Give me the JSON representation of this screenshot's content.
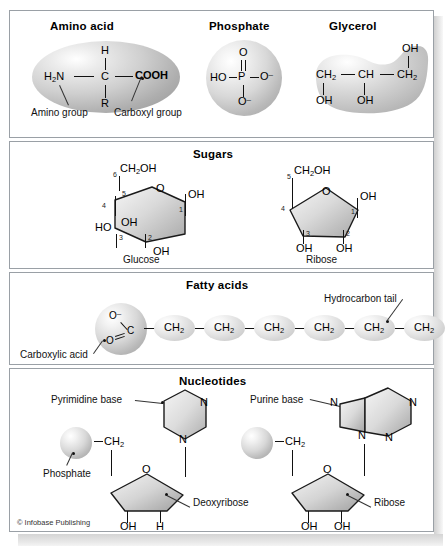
{
  "figure": {
    "credit": "© Infobase Publishing"
  },
  "panels": {
    "monomers": {
      "amino_acid": {
        "title": "Amino acid",
        "top_atom": "H",
        "left_group": "H2N",
        "center_atom": "C",
        "right_group": "COOH",
        "bottom_atom": "R",
        "callout_left": "Amino group",
        "callout_right": "Carboxyl group"
      },
      "phosphate": {
        "title": "Phosphate",
        "top_atom": "O",
        "left_group": "HO",
        "center_atom": "P",
        "right_group": "O−",
        "bottom_group": "O−"
      },
      "glycerol": {
        "title": "Glycerol",
        "c1": "CH2",
        "c2": "CH",
        "c3": "CH2",
        "oh1": "OH",
        "oh2": "OH",
        "oh3": "OH"
      }
    },
    "sugars": {
      "title": "Sugars",
      "glucose": {
        "name": "Glucose",
        "ring_o": "O",
        "c6_group": "CH2OH",
        "c1_group": "OH",
        "c2_group": "OH",
        "c3_group": "OH",
        "c4_group": "HO",
        "numbers": [
          "1",
          "2",
          "3",
          "4",
          "5",
          "6"
        ]
      },
      "ribose": {
        "name": "Ribose",
        "ring_o": "O",
        "c5_group": "CH2OH",
        "c1_group": "OH",
        "c2_group": "OH",
        "c3_group": "OH",
        "numbers": [
          "1",
          "2",
          "3",
          "4",
          "5"
        ]
      }
    },
    "fatty_acids": {
      "title": "Fatty acids",
      "carboxyl": {
        "o_top": "O−",
        "o_bottom": "O",
        "carbon": "C"
      },
      "chain": [
        "CH2",
        "CH2",
        "CH2",
        "CH2",
        "CH2",
        "CH2"
      ],
      "callout_carboxylic": "Carboxylic acid",
      "callout_tail": "Hydrocarbon tail"
    },
    "nucleotides": {
      "title": "Nucleotides",
      "left": {
        "base_label": "Pyrimidine base",
        "phosphate_label": "Phosphate",
        "linker": "CH2",
        "ring_o": "O",
        "sugar_label": "Deoxyribose",
        "sub_left": "OH",
        "sub_right": "H",
        "base_n_top": "N",
        "base_n_bottom": "N"
      },
      "right": {
        "base_label": "Purine base",
        "linker": "CH2",
        "ring_o": "O",
        "sugar_label": "Ribose",
        "sub_left": "OH",
        "sub_right": "OH",
        "base_n_five_top": "N",
        "base_n_five_bottom": "N",
        "base_n_six_top": "N",
        "base_n_six_bottom": "N"
      }
    }
  }
}
